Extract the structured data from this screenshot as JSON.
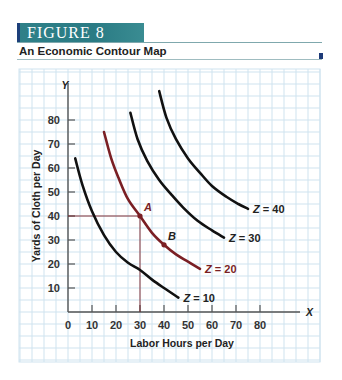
{
  "header": {
    "figure_label": "FIGURE  8",
    "subtitle": "An Economic Contour Map",
    "bar_color": "#2a7b84",
    "accent_color": "#1d3a78"
  },
  "chart_data": {
    "type": "line",
    "title": "An Economic Contour Map",
    "xlabel": "Labor Hours per Day",
    "ylabel": "Yards of Cloth per Day",
    "x_axis_symbol": "X",
    "y_axis_symbol": "Y",
    "xlim": [
      0,
      95
    ],
    "ylim": [
      0,
      95
    ],
    "x_ticks": [
      "0",
      "10",
      "20",
      "30",
      "40",
      "50",
      "60",
      "70",
      "80"
    ],
    "y_ticks": [
      "10",
      "20",
      "30",
      "40",
      "50",
      "60",
      "70",
      "80"
    ],
    "grid": true,
    "grid_color": "#cfe3ef",
    "series": [
      {
        "name": "Z = 10",
        "color": "#111111",
        "points": [
          [
            3,
            64
          ],
          [
            6,
            53
          ],
          [
            10,
            42
          ],
          [
            15,
            32
          ],
          [
            20,
            25
          ],
          [
            25,
            20.5
          ],
          [
            30,
            17.5
          ],
          [
            35,
            13.5
          ],
          [
            40,
            10
          ],
          [
            46,
            6
          ]
        ]
      },
      {
        "name": "Z = 20",
        "color": "#7a1f24",
        "points": [
          [
            15,
            75
          ],
          [
            18,
            64
          ],
          [
            21,
            56
          ],
          [
            25,
            47
          ],
          [
            30,
            40
          ],
          [
            35,
            33
          ],
          [
            40,
            28
          ],
          [
            45,
            24
          ],
          [
            50,
            21
          ],
          [
            55,
            18
          ]
        ]
      },
      {
        "name": "Z = 30",
        "color": "#111111",
        "points": [
          [
            26,
            83
          ],
          [
            29,
            72
          ],
          [
            33,
            63
          ],
          [
            38,
            55
          ],
          [
            43,
            49
          ],
          [
            48,
            43.5
          ],
          [
            54,
            38
          ],
          [
            60,
            34
          ],
          [
            65,
            31
          ]
        ]
      },
      {
        "name": "Z = 40",
        "color": "#111111",
        "points": [
          [
            38,
            92
          ],
          [
            41,
            81
          ],
          [
            45,
            72
          ],
          [
            50,
            64
          ],
          [
            55,
            58
          ],
          [
            60,
            52.5
          ],
          [
            66,
            48
          ],
          [
            71,
            45
          ],
          [
            75,
            43
          ]
        ]
      }
    ],
    "highlighted_points": [
      {
        "label": "A",
        "x": 30,
        "y": 40,
        "color": "#7a1f24",
        "dropline": true
      },
      {
        "label": "B",
        "x": 40,
        "y": 28,
        "color": "#7a1f24",
        "dropline": false
      }
    ],
    "highlighted_tick_color": "#7a1f24",
    "highlighted_ticks": {
      "x": "30",
      "y": "40"
    }
  }
}
